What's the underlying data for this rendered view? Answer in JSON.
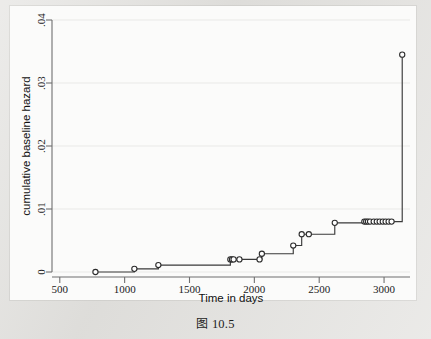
{
  "figure": {
    "caption_prefix": "图",
    "caption_number": "10.5",
    "caption_full": "图 10.5"
  },
  "chart_data": {
    "type": "line",
    "title": "",
    "subtitle": "",
    "xlabel": "Time in days",
    "ylabel": "cumulative baseline hazard",
    "xlim": [
      440,
      3200
    ],
    "ylim": [
      0,
      0.04
    ],
    "xticks": [
      500,
      1000,
      1500,
      2000,
      2500,
      3000
    ],
    "xtick_labels": [
      "500",
      "1000",
      "1500",
      "2000",
      "2500",
      "3000"
    ],
    "yticks": [
      0,
      0.01,
      0.02,
      0.03,
      0.04
    ],
    "ytick_labels": [
      "0",
      ".01",
      ".02",
      ".03",
      ".04"
    ],
    "grid": "horizontal",
    "legend": "none",
    "step_style": "post",
    "marker": "open-circle",
    "line_color": "#3a3a3a",
    "marker_color": "#2b2b2b",
    "series": [
      {
        "name": "cumulative baseline hazard",
        "x": [
          775,
          1075,
          1260,
          1815,
          1828,
          1840,
          1885,
          2040,
          2058,
          2300,
          2365,
          2420,
          2620,
          2848,
          2862,
          2876,
          2892,
          2920,
          2944,
          2966,
          2990,
          3012,
          3035,
          3058,
          3140
        ],
        "y": [
          0.0,
          0.0005,
          0.0011,
          0.002,
          0.002,
          0.002,
          0.002,
          0.002,
          0.0029,
          0.0042,
          0.006,
          0.006,
          0.0078,
          0.008,
          0.008,
          0.008,
          0.008,
          0.008,
          0.008,
          0.008,
          0.008,
          0.008,
          0.008,
          0.008,
          0.0345
        ]
      }
    ],
    "annotations": []
  }
}
